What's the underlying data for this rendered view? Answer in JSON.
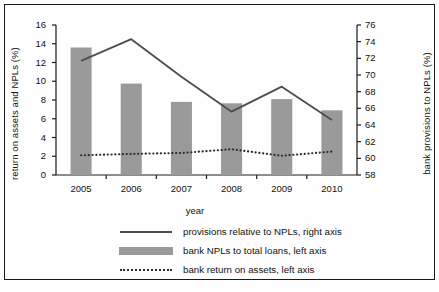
{
  "chart_data": {
    "type": "bar",
    "title": "",
    "xlabel": "year",
    "ylabel": "return on assets and NPLs (%)",
    "y2label": "bank provisions to NPLs (%)",
    "categories": [
      "2005",
      "2006",
      "2007",
      "2008",
      "2009",
      "2010"
    ],
    "ylim": [
      0,
      16
    ],
    "yticks": [
      0,
      2,
      4,
      6,
      8,
      10,
      12,
      14,
      16
    ],
    "y2lim": [
      58,
      76
    ],
    "y2ticks": [
      58,
      60,
      62,
      64,
      66,
      68,
      70,
      72,
      74,
      76
    ],
    "grid": false,
    "legend_position": "bottom",
    "series": [
      {
        "name": "provisions relative to NPLs, right axis",
        "type": "line",
        "axis": "right",
        "color": "#4d4d4d",
        "values": [
          71.7,
          74.3,
          69.8,
          65.6,
          68.6,
          64.6
        ]
      },
      {
        "name": "bank NPLs to total loans, left axis",
        "type": "bar",
        "axis": "left",
        "color": "#9a9a9a",
        "values": [
          13.6,
          9.75,
          7.8,
          7.65,
          8.1,
          6.9
        ]
      },
      {
        "name": "bank return on assets, left axis",
        "type": "line-dotted",
        "axis": "left",
        "color": "#2b2b2b",
        "values": [
          2.1,
          2.25,
          2.35,
          2.75,
          2.05,
          2.5
        ]
      }
    ]
  },
  "legend": {
    "items": [
      {
        "label": "provisions relative to NPLs, right axis",
        "key": "solid-line-key"
      },
      {
        "label": "bank NPLs to total loans, left axis",
        "key": "gray-bar-key"
      },
      {
        "label": "bank return on assets, left axis",
        "key": "dotted-line-key"
      }
    ]
  }
}
